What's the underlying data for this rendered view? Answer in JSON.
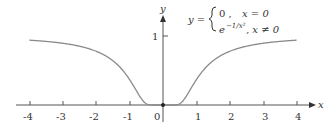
{
  "chart_data": {
    "type": "line",
    "title": "",
    "xlabel": "x",
    "ylabel": "y",
    "xlim": [
      -4.4,
      4.4
    ],
    "ylim": [
      0,
      1.1
    ],
    "x_ticks": [
      "-4",
      "-3",
      "-2",
      "-1",
      "0",
      "1",
      "2",
      "3",
      "4"
    ],
    "y_ticks": [
      "1"
    ],
    "grid": false,
    "legend": null,
    "annotation": {
      "lhs": "y =",
      "case1_value": "0 ,",
      "case1_condition": "x = 0",
      "case2_value": "e",
      "case2_exponent": "−1/x²",
      "case2_condition": ", x ≠ 0"
    },
    "series": [
      {
        "name": "y = e^(-1/x^2), y(0)=0",
        "x": [
          -4,
          -3.5,
          -3,
          -2.5,
          -2,
          -1.5,
          -1.25,
          -1,
          -0.8,
          -0.6,
          -0.5,
          -0.4,
          -0.3,
          -0.2,
          0,
          0.2,
          0.3,
          0.4,
          0.5,
          0.6,
          0.8,
          1,
          1.25,
          1.5,
          2,
          2.5,
          3,
          3.5,
          4
        ],
        "values": [
          0.939,
          0.922,
          0.895,
          0.852,
          0.779,
          0.641,
          0.527,
          0.368,
          0.21,
          0.062,
          0.018,
          0.002,
          0.0,
          0.0,
          0,
          0.0,
          0.0,
          0.002,
          0.018,
          0.062,
          0.21,
          0.368,
          0.527,
          0.641,
          0.779,
          0.852,
          0.895,
          0.922,
          0.939
        ]
      }
    ],
    "colors": {
      "curve": "#8a8a8a",
      "axis": "#444444",
      "point": "#222222"
    }
  }
}
